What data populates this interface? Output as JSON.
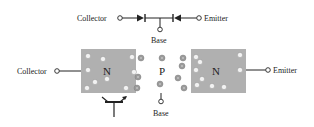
{
  "diagram": {
    "diode_model": {
      "collector_label": "Collector",
      "emitter_label": "Emitter",
      "base_label": "Base"
    },
    "structure": {
      "collector_label": "Collector",
      "emitter_label": "Emitter",
      "base_label": "Base",
      "regions": [
        {
          "label": "N",
          "role": "collector"
        },
        {
          "label": "P",
          "role": "base"
        },
        {
          "label": "N",
          "role": "emitter"
        }
      ],
      "carrier_types": {
        "N": "electron",
        "P": "hole"
      }
    },
    "colors": {
      "n_region": "#b0b0b0",
      "p_region": "#ffffff",
      "line": "#222222",
      "electron_fill": "#f2f2f2",
      "hole_fill": "#9a9a9a"
    },
    "symbol": "npn-transistor-symbol"
  }
}
